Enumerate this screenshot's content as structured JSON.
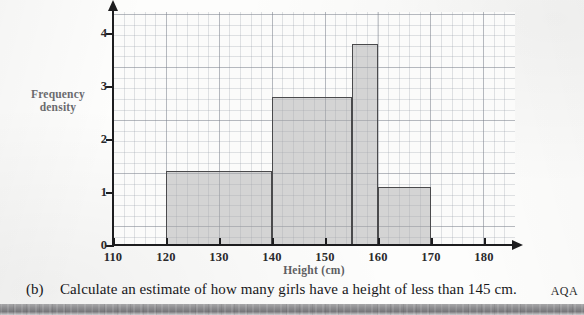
{
  "page": {
    "exam_board": "AQA"
  },
  "question": {
    "label": "(b)",
    "text": "Calculate an estimate of how many girls have a height of less than 145 cm."
  },
  "chart_data": {
    "type": "bar",
    "title": "",
    "xlabel": "Height (cm)",
    "ylabel": "Frequency density",
    "ylabel_line1": "Frequency",
    "ylabel_line2": "density",
    "xlim": [
      110,
      185
    ],
    "ylim": [
      0,
      4.4
    ],
    "grid": true,
    "grid_minor": true,
    "legend": "none",
    "xticks": [
      110,
      120,
      130,
      140,
      150,
      160,
      170,
      180
    ],
    "xtick_labels": [
      "110",
      "120",
      "130",
      "140",
      "150",
      "160",
      "170",
      "180"
    ],
    "yticks": [
      0,
      1,
      2,
      3,
      4
    ],
    "ytick_labels": [
      "0",
      "1",
      "2",
      "3",
      "4"
    ],
    "bins": [
      {
        "x0": 120,
        "x1": 140,
        "height": 1.4
      },
      {
        "x0": 140,
        "x1": 155,
        "height": 2.8
      },
      {
        "x0": 155,
        "x1": 160,
        "height": 3.8
      },
      {
        "x0": 160,
        "x1": 170,
        "height": 1.1
      }
    ],
    "bar_fill": "#aaaaac",
    "bar_edge": "#4a4a4c"
  }
}
